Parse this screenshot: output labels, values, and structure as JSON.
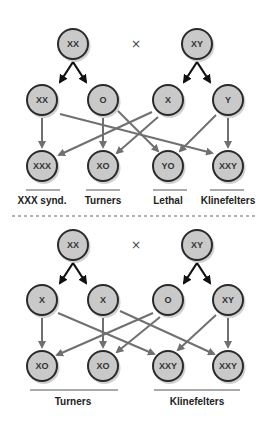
{
  "top_cross": {
    "parents": [
      {
        "label": "XX",
        "x": 73,
        "y": 44
      },
      {
        "label": "XY",
        "x": 197,
        "y": 44
      }
    ],
    "cross_symbol": "×",
    "gametes": [
      {
        "label": "XX",
        "x": 42,
        "y": 100
      },
      {
        "label": "O",
        "x": 103,
        "y": 100
      },
      {
        "label": "X",
        "x": 168,
        "y": 100
      },
      {
        "label": "Y",
        "x": 228,
        "y": 100
      }
    ],
    "offspring": [
      {
        "label": "XXX",
        "x": 42,
        "y": 166
      },
      {
        "label": "XO",
        "x": 103,
        "y": 166
      },
      {
        "label": "YO",
        "x": 168,
        "y": 166
      },
      {
        "label": "XXY",
        "x": 228,
        "y": 166
      }
    ],
    "outcomes": [
      {
        "label": "XXX synd.",
        "x": 42
      },
      {
        "label": "Turners",
        "x": 103
      },
      {
        "label": "Lethal",
        "x": 168
      },
      {
        "label": "Klinefelters",
        "x": 228
      }
    ]
  },
  "bottom_cross": {
    "parents": [
      {
        "label": "XX",
        "x": 73,
        "y": 245
      },
      {
        "label": "XY",
        "x": 197,
        "y": 245
      }
    ],
    "cross_symbol": "×",
    "gametes": [
      {
        "label": "X",
        "x": 42,
        "y": 300
      },
      {
        "label": "X",
        "x": 103,
        "y": 300
      },
      {
        "label": "O",
        "x": 168,
        "y": 300
      },
      {
        "label": "XY",
        "x": 228,
        "y": 300
      }
    ],
    "offspring": [
      {
        "label": "XO",
        "x": 42,
        "y": 366
      },
      {
        "label": "XO",
        "x": 103,
        "y": 366
      },
      {
        "label": "XXY",
        "x": 168,
        "y": 366
      },
      {
        "label": "XXY",
        "x": 228,
        "y": 366
      }
    ],
    "outcomes": [
      {
        "label": "Turners",
        "x": 73
      },
      {
        "label": "Klinefelters",
        "x": 197
      }
    ]
  },
  "colors": {
    "node_fill": "#c9c9c9",
    "node_stroke": "#2a2a2a",
    "connector": "#707070",
    "split_arrow": "#111111"
  }
}
